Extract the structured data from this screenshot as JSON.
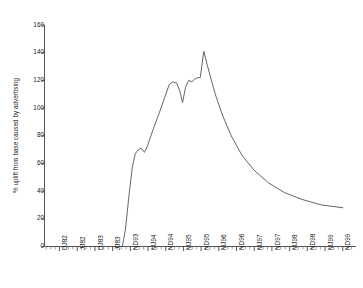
{
  "chart_data": {
    "type": "line",
    "title": "",
    "subtitle": "",
    "xlabel": "",
    "ylabel": "% uplift from base caused by advertising",
    "ylim": [
      0,
      160
    ],
    "ytick_values": [
      0,
      20,
      40,
      60,
      80,
      100,
      120,
      140,
      160
    ],
    "ytick_labels": [
      "0",
      "20",
      "40",
      "60",
      "80",
      "100",
      "120",
      "140",
      "160"
    ],
    "grid": false,
    "legend": null,
    "legend_position": "none",
    "categories": [
      "DJ82",
      "JJ82",
      "DJ83",
      "JJ83",
      "ND93",
      "MJ94",
      "ND94",
      "MJ95",
      "ND95",
      "MJ96",
      "ND96",
      "MJ97",
      "ND97",
      "MJ98",
      "ND98",
      "MJ99",
      "ND99"
    ],
    "series": [
      {
        "name": "% uplift from base caused by advertising",
        "color": "#555555",
        "points": [
          {
            "x": 0.0,
            "y": 0
          },
          {
            "x": 3.55,
            "y": 0
          },
          {
            "x": 3.72,
            "y": 12
          },
          {
            "x": 3.95,
            "y": 40
          },
          {
            "x": 4.12,
            "y": 58
          },
          {
            "x": 4.28,
            "y": 67
          },
          {
            "x": 4.45,
            "y": 70
          },
          {
            "x": 4.62,
            "y": 71
          },
          {
            "x": 4.8,
            "y": 68
          },
          {
            "x": 4.95,
            "y": 72
          },
          {
            "x": 5.3,
            "y": 85
          },
          {
            "x": 5.65,
            "y": 97
          },
          {
            "x": 5.95,
            "y": 108
          },
          {
            "x": 6.2,
            "y": 117
          },
          {
            "x": 6.4,
            "y": 119
          },
          {
            "x": 6.62,
            "y": 118
          },
          {
            "x": 6.8,
            "y": 112
          },
          {
            "x": 6.95,
            "y": 104
          },
          {
            "x": 7.12,
            "y": 115
          },
          {
            "x": 7.3,
            "y": 120
          },
          {
            "x": 7.48,
            "y": 119
          },
          {
            "x": 7.65,
            "y": 121
          },
          {
            "x": 7.82,
            "y": 122
          },
          {
            "x": 7.95,
            "y": 122
          },
          {
            "x": 8.15,
            "y": 141
          },
          {
            "x": 8.45,
            "y": 126
          },
          {
            "x": 8.8,
            "y": 110
          },
          {
            "x": 9.2,
            "y": 95
          },
          {
            "x": 9.7,
            "y": 80
          },
          {
            "x": 10.3,
            "y": 66
          },
          {
            "x": 11.0,
            "y": 55
          },
          {
            "x": 11.8,
            "y": 46
          },
          {
            "x": 12.7,
            "y": 39
          },
          {
            "x": 13.7,
            "y": 34
          },
          {
            "x": 14.8,
            "y": 30
          },
          {
            "x": 16.0,
            "y": 28
          }
        ]
      }
    ]
  }
}
